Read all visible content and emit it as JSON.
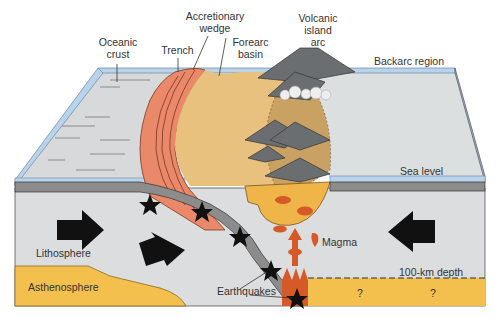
{
  "labels": {
    "oceanic_crust": "Oceanic\ncrust",
    "oceanic_crust_l1": "Oceanic",
    "oceanic_crust_l2": "crust",
    "trench": "Trench",
    "accretionary_wedge_l1": "Accretionary",
    "accretionary_wedge_l2": "wedge",
    "forearc_basin_l1": "Forearc",
    "forearc_basin_l2": "basin",
    "volcanic_island_arc_l1": "Volcanic",
    "volcanic_island_arc_l2": "island",
    "volcanic_island_arc_l3": "arc",
    "backarc_region": "Backarc region",
    "sea_level": "Sea level",
    "lithosphere": "Lithosphere",
    "asthenosphere": "Asthenosphere",
    "magma": "Magma",
    "depth_100km": "100-km depth",
    "earthquakes": "Earthquakes",
    "unknown_1": "?",
    "unknown_2": "?"
  },
  "colors": {
    "ocean_water": "#b9d3ea",
    "sea_floor_gray": "#d8dadb",
    "lithosphere_gray": "#dcdddf",
    "asthenosphere": "#f3c04e",
    "accretionary_wedge": "#e9896a",
    "forearc_basin": "#e8c17e",
    "arc_crust": "#c9a263",
    "volcano": "#6b6e70",
    "magma": "#d65a27",
    "slab": "#8c8c8c",
    "arrow": "#111111"
  }
}
